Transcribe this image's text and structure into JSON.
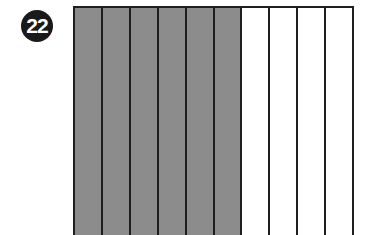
{
  "problem": {
    "number": "22"
  },
  "figure": {
    "type": "fraction-bar",
    "total_parts": 10,
    "shaded_parts": 6,
    "shade_color": "#8c8c8c",
    "line_color": "#1e1e1e"
  }
}
